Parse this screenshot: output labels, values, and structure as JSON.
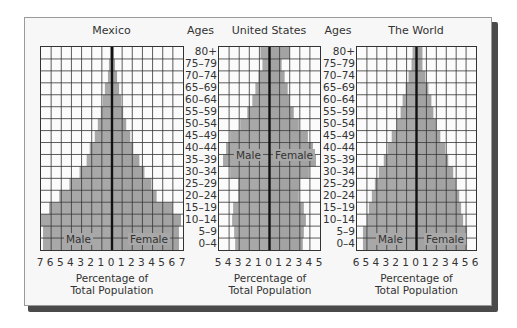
{
  "chart_data": [
    {
      "type": "bar",
      "subtype": "population-pyramid",
      "title": "Mexico",
      "xlabel": "Percentage of Total Population",
      "ylabel": "Ages",
      "xlim": [
        -7,
        7
      ],
      "x_tick_labels": [
        "7",
        "6",
        "5",
        "4",
        "3",
        "2",
        "1",
        "0",
        "1",
        "2",
        "3",
        "4",
        "5",
        "6",
        "7"
      ],
      "categories": [
        "0–4",
        "5–9",
        "10–14",
        "15–19",
        "20–24",
        "25–29",
        "30–34",
        "35–39",
        "40–44",
        "45–49",
        "50–54",
        "55–59",
        "60–64",
        "65–69",
        "70–74",
        "75–79",
        "80+"
      ],
      "series": [
        {
          "name": "Male",
          "values": [
            6.8,
            6.8,
            7.0,
            6.2,
            5.2,
            4.2,
            3.2,
            2.5,
            2.2,
            1.7,
            1.4,
            1.1,
            0.9,
            0.7,
            0.4,
            0.3,
            0.2
          ]
        },
        {
          "name": "Female",
          "values": [
            6.6,
            6.6,
            6.8,
            6.0,
            4.4,
            3.9,
            3.2,
            2.7,
            2.1,
            1.8,
            1.4,
            1.1,
            0.9,
            0.7,
            0.5,
            0.3,
            0.2
          ]
        }
      ],
      "grid": true,
      "legend": [
        "Male",
        "Female"
      ]
    },
    {
      "type": "bar",
      "subtype": "population-pyramid",
      "title": "United States",
      "xlabel": "Percentage of Total Population",
      "ylabel": "Ages",
      "xlim": [
        -5,
        5
      ],
      "x_tick_labels": [
        "5",
        "4",
        "3",
        "2",
        "1",
        "0",
        "1",
        "2",
        "3",
        "4",
        "5"
      ],
      "categories": [
        "0–4",
        "5–9",
        "10–14",
        "15–19",
        "20–24",
        "25–29",
        "30–34",
        "35–39",
        "40–44",
        "45–49",
        "50–54",
        "55–59",
        "60–64",
        "65–69",
        "70–74",
        "75–79",
        "80+"
      ],
      "series": [
        {
          "name": "Male",
          "values": [
            3.4,
            3.5,
            3.7,
            3.6,
            3.1,
            3.1,
            3.9,
            4.6,
            4.3,
            3.9,
            2.9,
            2.2,
            1.7,
            1.4,
            1.1,
            0.7,
            0.9
          ]
        },
        {
          "name": "Female",
          "values": [
            3.3,
            3.4,
            3.6,
            3.4,
            2.9,
            3.0,
            3.9,
            4.6,
            4.3,
            3.8,
            2.9,
            2.4,
            2.0,
            1.8,
            1.5,
            1.2,
            2.0
          ]
        }
      ],
      "grid": true,
      "legend": [
        "Male",
        "Female"
      ]
    },
    {
      "type": "bar",
      "subtype": "population-pyramid",
      "title": "The World",
      "xlabel": "Percentage of Total Population",
      "ylabel": "Ages",
      "xlim": [
        -6,
        6
      ],
      "x_tick_labels": [
        "6",
        "5",
        "4",
        "3",
        "2",
        "1",
        "0",
        "1",
        "2",
        "3",
        "4",
        "5",
        "6"
      ],
      "categories": [
        "0–4",
        "5–9",
        "10–14",
        "15–19",
        "20–24",
        "25–29",
        "30–34",
        "35–39",
        "40–44",
        "45–49",
        "50–54",
        "55–59",
        "60–64",
        "65–69",
        "70–74",
        "75–79",
        "80+"
      ],
      "series": [
        {
          "name": "Male",
          "values": [
            5.4,
            5.4,
            5.0,
            4.8,
            4.5,
            4.2,
            3.8,
            3.3,
            2.9,
            2.5,
            2.0,
            1.6,
            1.4,
            1.1,
            0.8,
            0.5,
            0.4
          ]
        },
        {
          "name": "Female",
          "values": [
            5.1,
            5.1,
            4.7,
            4.5,
            4.3,
            4.0,
            3.7,
            3.2,
            2.9,
            2.4,
            2.0,
            1.7,
            1.5,
            1.2,
            0.9,
            0.6,
            0.6
          ]
        }
      ],
      "grid": true,
      "legend": [
        "Male",
        "Female"
      ]
    }
  ],
  "labels": {
    "ages_header": "Ages",
    "age_groups_top_down": [
      "80+",
      "75–79",
      "70–74",
      "65–69",
      "60–64",
      "55–59",
      "50–54",
      "45–49",
      "40–44",
      "35–39",
      "30–34",
      "25–29",
      "20–24",
      "15–19",
      "10–14",
      "5–9",
      "0–4"
    ],
    "xlabel_line1": "Percentage of",
    "xlabel_line2": "Total Population",
    "male": "Male",
    "female": "Female"
  },
  "colors": {
    "bar_male": "#a8a8a8",
    "bar_female": "#a3a3a3",
    "bar_edge": "#c9c9c9",
    "grid_line": "#333333",
    "center_line": "#111111",
    "card_bg": "#f7f7f7",
    "shadow": "#4a4a4a"
  }
}
